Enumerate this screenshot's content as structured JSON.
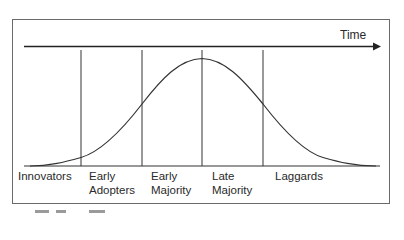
{
  "diagram": {
    "axis_label": "Time",
    "colors": {
      "line": "#222222",
      "frame": "#6a6a6a",
      "text": "#2a2a2a"
    },
    "categories": [
      {
        "line1": "Innovators",
        "line2": ""
      },
      {
        "line1": "Early",
        "line2": "Adopters"
      },
      {
        "line1": "Early",
        "line2": "Majority"
      },
      {
        "line1": "Late",
        "line2": "Majority"
      },
      {
        "line1": "Laggards",
        "line2": ""
      }
    ],
    "curve": "bell (normal distribution)",
    "divider_positions_x": [
      81,
      142,
      202,
      263
    ]
  }
}
